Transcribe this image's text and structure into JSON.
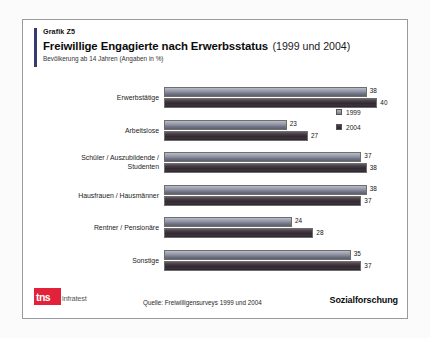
{
  "header": {
    "kicker": "Grafik Z5",
    "title_main": "Freiwillige Engagierte nach Erwerbsstatus",
    "title_sub": "(1999 und 2004)",
    "note": "Bevölkerung ab 14 Jahren (Angaben in %)"
  },
  "legend": {
    "items": [
      {
        "label": "1999",
        "color": "#8f93a3"
      },
      {
        "label": "2004",
        "color": "#322a32"
      }
    ]
  },
  "footer": {
    "logo_badge": "tns",
    "logo_word": "infratest",
    "source": "Quelle: Freiwilligensurveys 1999 und 2004",
    "tagline": "Sozialforschung",
    "brand_color": "#e2223b"
  },
  "chart_data": {
    "type": "bar",
    "orientation": "horizontal",
    "title": "Freiwillige Engagierte nach Erwerbsstatus (1999 und 2004)",
    "subtitle": "Bevölkerung ab 14 Jahren (Angaben in %)",
    "xlabel": "",
    "ylabel": "",
    "xlim": [
      0,
      45
    ],
    "grid": false,
    "legend_position": "right",
    "categories": [
      "Erwerbstätige",
      "Arbeitslose",
      "Schüler / Auszubildende /\nStudenten",
      "Hausfrauen / Hausmänner",
      "Rentner / Pensionäre",
      "Sonstige"
    ],
    "category_lines": [
      [
        "Erwerbstätige"
      ],
      [
        "Arbeitslose"
      ],
      [
        "Schüler / Auszubildende /",
        "Studenten"
      ],
      [
        "Hausfrauen / Hausmänner"
      ],
      [
        "Rentner / Pensionäre"
      ],
      [
        "Sonstige"
      ]
    ],
    "series": [
      {
        "name": "1999",
        "values": [
          38,
          23,
          37,
          38,
          24,
          35
        ]
      },
      {
        "name": "2004",
        "values": [
          40,
          27,
          38,
          37,
          28,
          37
        ]
      }
    ],
    "source": "Quelle: Freiwilligensurveys 1999 und 2004"
  }
}
